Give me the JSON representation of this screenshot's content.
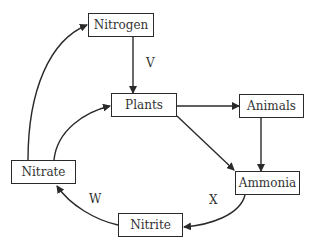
{
  "diagram": {
    "type": "nitrogen-cycle",
    "nodes": [
      {
        "id": "nitrogen",
        "label": "Nitrogen"
      },
      {
        "id": "plants",
        "label": "Plants"
      },
      {
        "id": "animals",
        "label": "Animals"
      },
      {
        "id": "nitrate",
        "label": "Nitrate"
      },
      {
        "id": "ammonia",
        "label": "Ammonia"
      },
      {
        "id": "nitrite",
        "label": "Nitrite"
      }
    ],
    "edges": [
      {
        "from": "nitrogen",
        "to": "plants",
        "label": "V"
      },
      {
        "from": "plants",
        "to": "animals",
        "label": ""
      },
      {
        "from": "plants",
        "to": "ammonia",
        "label": ""
      },
      {
        "from": "animals",
        "to": "ammonia",
        "label": ""
      },
      {
        "from": "ammonia",
        "to": "nitrite",
        "label": "X"
      },
      {
        "from": "nitrite",
        "to": "nitrate",
        "label": "W"
      },
      {
        "from": "nitrate",
        "to": "plants",
        "label": ""
      },
      {
        "from": "nitrate",
        "to": "nitrogen",
        "label": ""
      }
    ],
    "labels": {
      "v": "V",
      "w": "W",
      "x": "X"
    },
    "colors": {
      "line": "#2a2a2a",
      "text": "#333333",
      "background": "#ffffff"
    }
  }
}
